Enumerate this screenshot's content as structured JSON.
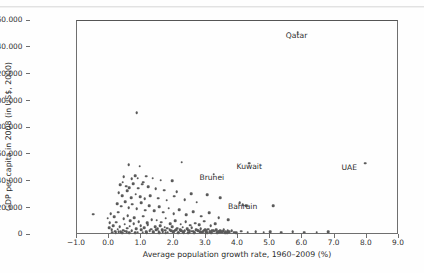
{
  "figure": {
    "kind": "scatter-plot",
    "background": "#fefefe",
    "point_color": "#5a5a5a",
    "axis_color": "#6f6f6f"
  },
  "chart_data": {
    "type": "scatter",
    "title": "",
    "xlabel": "Average population growth rate, 1960–2009 (%)",
    "ylabel": "GDP per capita in 2008 (in US$, 2000)",
    "xlim": [
      -1.0,
      9.0
    ],
    "ylim": [
      0,
      160000
    ],
    "grid": false,
    "legend": null,
    "xticks": [
      -1.0,
      0.0,
      1.0,
      2.0,
      3.0,
      4.0,
      5.0,
      6.0,
      7.0,
      8.0,
      9.0
    ],
    "xticklabels": [
      "−1.0",
      "0.0",
      "1.0",
      "2.0",
      "3.0",
      "4.0",
      "5.0",
      "6.0",
      "7.0",
      "8.0",
      "9.0"
    ],
    "yticks": [
      0,
      20000,
      40000,
      60000,
      80000,
      100000,
      120000,
      140000,
      160000
    ],
    "yticklabels": [
      "0",
      "20.000",
      "40.000",
      "60.000",
      "80.000",
      "100.000",
      "120.000",
      "140.000",
      "160.000"
    ],
    "annotations": [
      {
        "label": "Qatar",
        "x": 5.85,
        "y": 150000,
        "dx": 0,
        "dy": -9
      },
      {
        "label": "UAE",
        "x": 7.95,
        "y": 52000,
        "dx": -15,
        "dy": -8
      },
      {
        "label": "Kuwait",
        "x": 4.35,
        "y": 52000,
        "dx": 1,
        "dy": -9
      },
      {
        "label": "Brunei",
        "x": 3.25,
        "y": 44000,
        "dx": -1,
        "dy": -9
      },
      {
        "label": "Bahrain",
        "x": 4.05,
        "y": 22500,
        "dx": 4,
        "dy": -9
      }
    ],
    "points": [
      [
        5.85,
        150000
      ],
      [
        0.85,
        90000
      ],
      [
        7.95,
        52000
      ],
      [
        4.35,
        52000
      ],
      [
        2.25,
        53000
      ],
      [
        3.25,
        44000
      ],
      [
        4.05,
        22500
      ],
      [
        0.6,
        51000
      ],
      [
        0.95,
        50000
      ],
      [
        0.45,
        42000
      ],
      [
        0.7,
        40500
      ],
      [
        0.8,
        43000
      ],
      [
        0.88,
        41000
      ],
      [
        1.05,
        38000
      ],
      [
        1.15,
        42500
      ],
      [
        1.35,
        41000
      ],
      [
        1.6,
        39500
      ],
      [
        1.95,
        39000
      ],
      [
        0.35,
        36000
      ],
      [
        0.42,
        38000
      ],
      [
        0.52,
        35000
      ],
      [
        0.62,
        34000
      ],
      [
        0.74,
        37000
      ],
      [
        0.9,
        33500
      ],
      [
        1.02,
        36500
      ],
      [
        1.22,
        34500
      ],
      [
        1.45,
        33000
      ],
      [
        1.7,
        32000
      ],
      [
        2.1,
        31000
      ],
      [
        2.55,
        29500
      ],
      [
        3.05,
        28500
      ],
      [
        0.3,
        30000
      ],
      [
        0.4,
        28000
      ],
      [
        0.55,
        31500
      ],
      [
        0.68,
        26500
      ],
      [
        0.82,
        29000
      ],
      [
        0.96,
        27000
      ],
      [
        1.1,
        25500
      ],
      [
        1.28,
        28000
      ],
      [
        1.52,
        26000
      ],
      [
        1.78,
        24500
      ],
      [
        2.02,
        27500
      ],
      [
        2.35,
        25000
      ],
      [
        2.72,
        23000
      ],
      [
        3.45,
        26500
      ],
      [
        4.15,
        21000
      ],
      [
        4.25,
        20500
      ],
      [
        5.1,
        20500
      ],
      [
        0.25,
        22000
      ],
      [
        0.38,
        20000
      ],
      [
        0.5,
        23500
      ],
      [
        0.6,
        19000
      ],
      [
        0.72,
        21500
      ],
      [
        0.86,
        18000
      ],
      [
        1.0,
        22500
      ],
      [
        1.12,
        17000
      ],
      [
        1.25,
        20500
      ],
      [
        1.4,
        16500
      ],
      [
        1.55,
        19500
      ],
      [
        1.68,
        15500
      ],
      [
        1.85,
        18500
      ],
      [
        2.0,
        14500
      ],
      [
        2.18,
        17500
      ],
      [
        2.4,
        13500
      ],
      [
        2.6,
        16000
      ],
      [
        2.85,
        12500
      ],
      [
        3.1,
        15000
      ],
      [
        3.4,
        11500
      ],
      [
        3.7,
        10000
      ],
      [
        0.05,
        14500
      ],
      [
        0.15,
        12000
      ],
      [
        0.28,
        15500
      ],
      [
        0.45,
        10500
      ],
      [
        0.58,
        13000
      ],
      [
        0.66,
        9000
      ],
      [
        0.78,
        11500
      ],
      [
        0.92,
        8500
      ],
      [
        1.06,
        12500
      ],
      [
        1.18,
        7500
      ],
      [
        1.32,
        10000
      ],
      [
        1.48,
        9500
      ],
      [
        1.62,
        8000
      ],
      [
        1.75,
        11000
      ],
      [
        1.9,
        7000
      ],
      [
        2.05,
        9200
      ],
      [
        2.22,
        6500
      ],
      [
        2.38,
        8200
      ],
      [
        2.52,
        5800
      ],
      [
        2.68,
        7200
      ],
      [
        2.8,
        6000
      ],
      [
        2.95,
        8800
      ],
      [
        3.15,
        5200
      ],
      [
        3.3,
        6800
      ],
      [
        -0.5,
        14000
      ],
      [
        -0.05,
        11000
      ],
      [
        0.02,
        7500
      ],
      [
        0.12,
        5500
      ],
      [
        0.22,
        8000
      ],
      [
        0.33,
        4500
      ],
      [
        0.48,
        6500
      ],
      [
        0.56,
        3500
      ],
      [
        0.64,
        5000
      ],
      [
        0.76,
        6800
      ],
      [
        0.84,
        3000
      ],
      [
        0.98,
        5200
      ],
      [
        1.08,
        4000
      ],
      [
        1.2,
        6200
      ],
      [
        1.3,
        2800
      ],
      [
        1.42,
        4800
      ],
      [
        1.5,
        3200
      ],
      [
        1.58,
        5500
      ],
      [
        1.65,
        2200
      ],
      [
        1.72,
        4200
      ],
      [
        1.8,
        3600
      ],
      [
        1.88,
        2500
      ],
      [
        1.96,
        4600
      ],
      [
        2.04,
        1800
      ],
      [
        2.12,
        3400
      ],
      [
        2.2,
        2600
      ],
      [
        2.28,
        4200
      ],
      [
        2.34,
        1500
      ],
      [
        2.42,
        3000
      ],
      [
        2.48,
        2000
      ],
      [
        2.56,
        3800
      ],
      [
        2.62,
        1300
      ],
      [
        2.7,
        2400
      ],
      [
        2.76,
        1700
      ],
      [
        2.84,
        3200
      ],
      [
        2.9,
        1100
      ],
      [
        2.98,
        2200
      ],
      [
        3.02,
        1600
      ],
      [
        3.08,
        2900
      ],
      [
        3.14,
        1000
      ],
      [
        3.2,
        2000
      ],
      [
        3.26,
        1400
      ],
      [
        3.32,
        2600
      ],
      [
        3.38,
        900
      ],
      [
        3.44,
        1800
      ],
      [
        3.5,
        1200
      ],
      [
        3.56,
        2300
      ],
      [
        3.62,
        800
      ],
      [
        3.68,
        1600
      ],
      [
        0.08,
        2200
      ],
      [
        0.18,
        1200
      ],
      [
        0.26,
        2800
      ],
      [
        0.36,
        700
      ],
      [
        0.44,
        1900
      ],
      [
        0.54,
        900
      ],
      [
        0.7,
        1500
      ],
      [
        0.88,
        600
      ],
      [
        1.0,
        2400
      ],
      [
        1.14,
        1100
      ],
      [
        1.26,
        1800
      ],
      [
        1.38,
        500
      ],
      [
        1.46,
        2600
      ],
      [
        1.54,
        1400
      ],
      [
        1.66,
        800
      ],
      [
        1.74,
        2100
      ],
      [
        1.82,
        400
      ],
      [
        1.92,
        1700
      ],
      [
        2.0,
        1000
      ],
      [
        2.08,
        2300
      ],
      [
        2.16,
        600
      ],
      [
        2.24,
        1500
      ],
      [
        2.32,
        300
      ],
      [
        2.44,
        1900
      ],
      [
        2.5,
        700
      ],
      [
        2.58,
        1300
      ],
      [
        2.66,
        400
      ],
      [
        2.74,
        2000
      ],
      [
        2.82,
        900
      ],
      [
        2.88,
        500
      ],
      [
        2.94,
        1600
      ],
      [
        3.04,
        300
      ],
      [
        3.12,
        1200
      ],
      [
        3.18,
        700
      ],
      [
        3.24,
        1800
      ],
      [
        3.34,
        400
      ],
      [
        3.42,
        1000
      ],
      [
        3.48,
        600
      ],
      [
        3.54,
        1400
      ],
      [
        3.6,
        250
      ],
      [
        3.72,
        900
      ],
      [
        3.8,
        1500
      ],
      [
        3.88,
        500
      ],
      [
        3.95,
        300
      ],
      [
        4.1,
        1200
      ],
      [
        4.3,
        600
      ],
      [
        4.55,
        900
      ],
      [
        4.8,
        400
      ],
      [
        5.0,
        1100
      ],
      [
        5.35,
        600
      ],
      [
        5.7,
        900
      ],
      [
        6.05,
        500
      ],
      [
        6.45,
        400
      ],
      [
        6.8,
        800
      ],
      [
        0.0,
        3800
      ],
      [
        0.1,
        400
      ],
      [
        0.2,
        300
      ],
      [
        0.3,
        900
      ],
      [
        0.4,
        200
      ],
      [
        0.5,
        1300
      ],
      [
        0.62,
        350
      ],
      [
        0.8,
        250
      ],
      [
        1.04,
        600
      ],
      [
        1.16,
        200
      ],
      [
        1.36,
        1000
      ],
      [
        1.56,
        300
      ],
      [
        1.76,
        150
      ],
      [
        1.98,
        700
      ],
      [
        2.14,
        200
      ],
      [
        2.3,
        1100
      ],
      [
        2.46,
        250
      ],
      [
        2.64,
        150
      ],
      [
        2.86,
        600
      ],
      [
        3.0,
        200
      ],
      [
        3.16,
        350
      ],
      [
        3.36,
        150
      ],
      [
        3.52,
        800
      ],
      [
        3.66,
        200
      ]
    ]
  }
}
